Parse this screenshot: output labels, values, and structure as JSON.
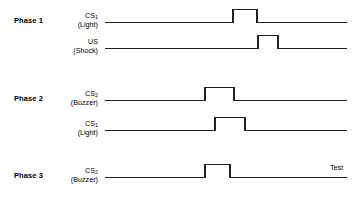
{
  "figure": {
    "type": "conditioning-timeline-diagram",
    "background_color": "#ffffff",
    "line_color": "#231f20"
  },
  "phases": [
    {
      "id": "phase-1",
      "title": "Phase 1",
      "title_x": 14,
      "title_y": 16,
      "traces": [
        {
          "id": "phase1-cs1",
          "name": "CS",
          "subscript": "1",
          "paren": "(Light)",
          "label_right_x": 98,
          "label_y": 12,
          "baseline_y": 22,
          "start_x": 105,
          "end_x": 347,
          "pulse_height": 13,
          "pulses": [
            {
              "start_x": 233,
              "end_x": 257
            }
          ]
        },
        {
          "id": "phase1-us",
          "name": "US",
          "subscript": "",
          "paren": "(Shock)",
          "label_right_x": 98,
          "label_y": 38,
          "baseline_y": 48,
          "start_x": 105,
          "end_x": 347,
          "pulse_height": 13,
          "pulses": [
            {
              "start_x": 258,
              "end_x": 278
            }
          ]
        }
      ]
    },
    {
      "id": "phase-2",
      "title": "Phase 2",
      "title_x": 14,
      "title_y": 94,
      "traces": [
        {
          "id": "phase2-cs2",
          "name": "CS",
          "subscript": "2",
          "paren": "(Buzzer)",
          "label_right_x": 98,
          "label_y": 90,
          "baseline_y": 100,
          "start_x": 105,
          "end_x": 347,
          "pulse_height": 13,
          "pulses": [
            {
              "start_x": 205,
              "end_x": 234
            }
          ]
        },
        {
          "id": "phase2-cs1",
          "name": "CS",
          "subscript": "1",
          "paren": "(Light)",
          "label_right_x": 98,
          "label_y": 120,
          "baseline_y": 130,
          "start_x": 105,
          "end_x": 347,
          "pulse_height": 13,
          "pulses": [
            {
              "start_x": 215,
              "end_x": 245
            }
          ]
        }
      ]
    },
    {
      "id": "phase-3",
      "title": "Phase 3",
      "title_x": 14,
      "title_y": 171,
      "traces": [
        {
          "id": "phase3-cs2",
          "name": "CS",
          "subscript": "2",
          "paren": "(Buzzer)",
          "label_right_x": 98,
          "label_y": 167,
          "baseline_y": 177,
          "start_x": 105,
          "end_x": 347,
          "pulse_height": 13,
          "pulses": [
            {
              "start_x": 205,
              "end_x": 230
            }
          ]
        }
      ]
    }
  ],
  "annotations": [
    {
      "id": "test-annotation",
      "text": "Test",
      "x": 330,
      "y": 170
    }
  ]
}
